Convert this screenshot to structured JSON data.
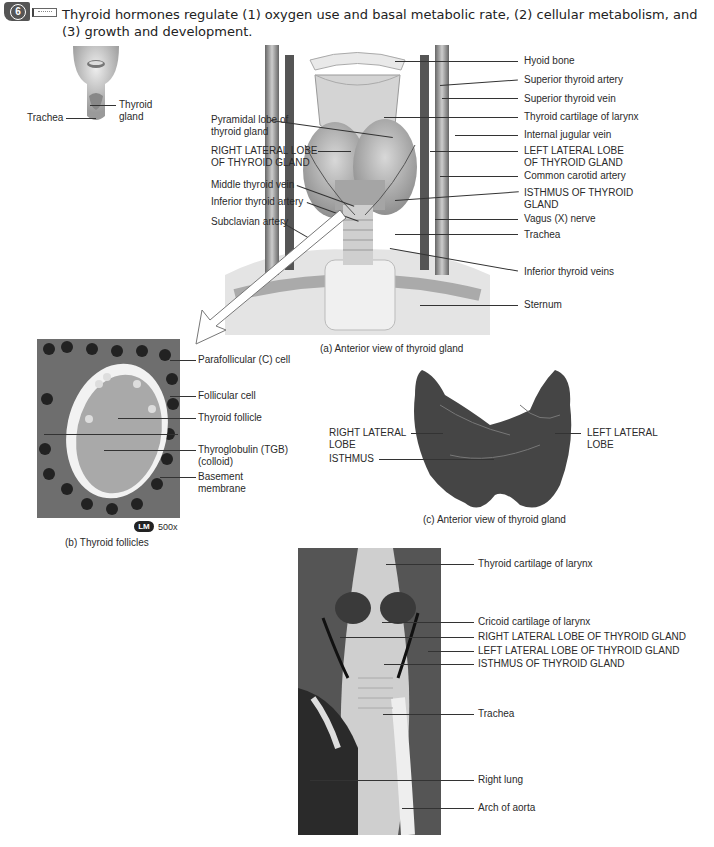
{
  "header": {
    "badge_number": "6",
    "intro_text": "Thyroid hormones regulate (1) oxygen use and basal metabolic rate, (2) cellular metabolism, and (3) growth and development."
  },
  "locator": {
    "labels": {
      "trachea": "Trachea",
      "thyroid_gland_1": "Thyroid",
      "thyroid_gland_2": "gland"
    }
  },
  "figure_a": {
    "caption": "(a) Anterior view of thyroid gland",
    "left_labels": [
      {
        "l1": "Pyramidal lobe of",
        "l2": "thyroid gland"
      },
      {
        "l1": "RIGHT LATERAL LOBE",
        "l2": "OF THYROID GLAND"
      },
      {
        "l1": "Middle thyroid vein",
        "l2": ""
      },
      {
        "l1": "Inferior thyroid artery",
        "l2": ""
      },
      {
        "l1": "Subclavian artery",
        "l2": ""
      }
    ],
    "right_labels": [
      {
        "l1": "Hyoid bone",
        "l2": ""
      },
      {
        "l1": "Superior thyroid artery",
        "l2": ""
      },
      {
        "l1": "Superior thyroid vein",
        "l2": ""
      },
      {
        "l1": "Thyroid cartilage of larynx",
        "l2": ""
      },
      {
        "l1": "Internal jugular vein",
        "l2": ""
      },
      {
        "l1": "LEFT LATERAL LOBE",
        "l2": "OF THYROID GLAND"
      },
      {
        "l1": "Common carotid artery",
        "l2": ""
      },
      {
        "l1": "ISTHMUS OF THYROID",
        "l2": "GLAND"
      },
      {
        "l1": "Vagus (X) nerve",
        "l2": ""
      },
      {
        "l1": "Trachea",
        "l2": ""
      },
      {
        "l1": "Inferior thyroid veins",
        "l2": ""
      },
      {
        "l1": "Sternum",
        "l2": ""
      }
    ]
  },
  "figure_b": {
    "caption": "(b) Thyroid follicles",
    "lm_badge": "LM",
    "magnification": "500x",
    "labels": [
      {
        "l1": "Parafollicular (C) cell",
        "l2": ""
      },
      {
        "l1": "Follicular cell",
        "l2": ""
      },
      {
        "l1": "Thyroid follicle",
        "l2": ""
      },
      {
        "l1": "Thyroglobulin (TGB)",
        "l2": "(colloid)"
      },
      {
        "l1": "Basement",
        "l2": "membrane"
      }
    ]
  },
  "figure_c": {
    "caption": "(c) Anterior view of thyroid gland",
    "labels": {
      "right_lobe_1": "RIGHT LATERAL",
      "right_lobe_2": "LOBE",
      "isthmus": "ISTHMUS",
      "left_lobe_1": "LEFT LATERAL",
      "left_lobe_2": "LOBE"
    }
  },
  "figure_d": {
    "labels": [
      "Thyroid cartilage of larynx",
      "Cricoid cartilage of larynx",
      "RIGHT LATERAL LOBE OF THYROID GLAND",
      "LEFT LATERAL LOBE OF THYROID GLAND",
      "ISTHMUS OF THYROID GLAND",
      "Trachea",
      "Right lung",
      "Arch of aorta"
    ]
  }
}
